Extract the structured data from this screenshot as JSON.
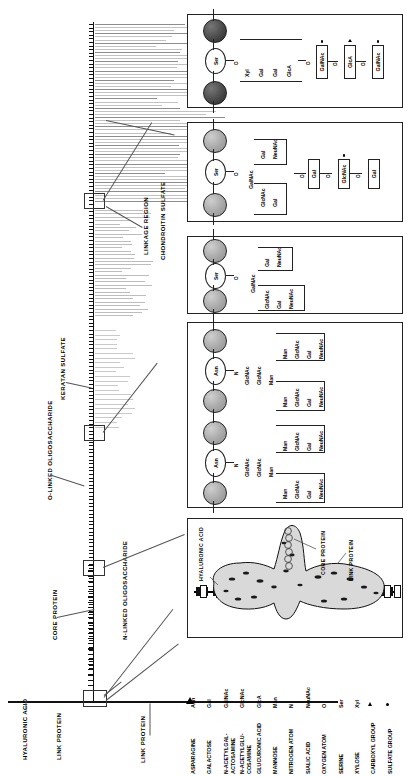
{
  "figure": {
    "orientation": "rotated-90"
  },
  "axis_labels": {
    "hyaluronic_acid": "HYALURONIC ACID",
    "link_protein_1": "LINK PROTEIN",
    "link_protein_2": "LINK PROTEIN",
    "core_protein": "CORE PROTEIN",
    "n_linked": "N-LINKED OLIGOSACCHARIDE",
    "o_linked": "O-LINKED OLIGOSACCHARIDE",
    "keratan_sulfate": "KERATAN SULFATE",
    "linkage_region": "LINKAGE REGION",
    "chondroitin_sulfate": "CHONDROITIN SULFATE"
  },
  "panels": {
    "chondroitin": {
      "name": "chondroitin-sulfate-panel",
      "residue": "Ser",
      "bond": "O",
      "linkage_chain": [
        "Xyl",
        "Gal",
        "Gal",
        "GlcA"
      ],
      "repeat": [
        {
          "label": "GalNAc",
          "modifier": "sulfate"
        },
        {
          "label": "GlcA",
          "modifier": "carboxyl"
        },
        {
          "label": "GalNAc",
          "modifier": "sulfate"
        }
      ],
      "bond_marks": [
        "O",
        "O",
        "O",
        "O"
      ]
    },
    "keratan": {
      "name": "keratan-sulfate-panel",
      "residue": "Ser",
      "bond": "O",
      "core": [
        "GalNAc"
      ],
      "branch_upper": [
        "Gal",
        "NeuNAc"
      ],
      "branch_lower": [
        "GlcNAc",
        "Gal"
      ],
      "repeat": [
        {
          "label": "Gal",
          "modifier": ""
        },
        {
          "label": "GlcNAc",
          "modifier": "sulfate"
        },
        {
          "label": "Gal",
          "modifier": ""
        }
      ]
    },
    "o_linked": {
      "name": "o-linked-oligosaccharide-panel",
      "residue": "Ser",
      "bond": "O",
      "core": [
        "GalNAc"
      ],
      "branch_upper": [
        "Gal",
        "NeuNAc"
      ],
      "branch_lower": [
        "GlcNAc",
        "Gal",
        "NeuNAc"
      ]
    },
    "n_linked": {
      "name": "n-linked-oligosaccharide-panel",
      "residue": "Asn",
      "bond": "N",
      "core": [
        "GlcNAc",
        "GlcNAc",
        "Man"
      ],
      "branch_upper": [
        "Man",
        "GlcNAc",
        "Gal",
        "NeuNAc"
      ],
      "branch_lower": [
        "Man",
        "GlcNAc",
        "Gal",
        "NeuNAc"
      ],
      "units": 2
    },
    "aggregate": {
      "name": "proteoglycan-aggregate-panel",
      "labels": {
        "hyaluronic_acid": "HYALURONIC ACID",
        "core_protein": "CORE PROTEIN",
        "link_protein": "LINK PROTEIN"
      }
    }
  },
  "legend": {
    "name": "abbreviation-legend",
    "entries": [
      {
        "abbr": "Asn",
        "name": "ASPARAGINE",
        "symbol": "text"
      },
      {
        "abbr": "Gal",
        "name": "GALACTOSE",
        "symbol": "text"
      },
      {
        "abbr": "GalNAc",
        "name": "N-ACETYLGAL-\nACTOSAMINE",
        "symbol": "text"
      },
      {
        "abbr": "GlcNAc",
        "name": "N-ACETYLGLU-\nCOSAMINE",
        "symbol": "text"
      },
      {
        "abbr": "GlcA",
        "name": "GLUCURONIC ACID",
        "symbol": "text"
      },
      {
        "abbr": "Man",
        "name": "MANNOSE",
        "symbol": "text"
      },
      {
        "abbr": "N",
        "name": "NITROGEN ATOM",
        "symbol": "text"
      },
      {
        "abbr": "NeuNAc",
        "name": "SIALIC ACID",
        "symbol": "text"
      },
      {
        "abbr": "O",
        "name": "OXYGEN ATOM",
        "symbol": "text"
      },
      {
        "abbr": "Ser",
        "name": "SERINE",
        "symbol": "text"
      },
      {
        "abbr": "Xyl",
        "name": "XYLOSE",
        "symbol": "text"
      },
      {
        "abbr": "",
        "name": "CARBOXYL GROUP",
        "symbol": "triangle"
      },
      {
        "abbr": "",
        "name": "SULFATE GROUP",
        "symbol": "dot"
      }
    ]
  },
  "colors": {
    "ink": "#111111",
    "gag_chain": "#b7b7b7",
    "panel_border": "#222222",
    "blob_fill": "#d9d9d9"
  }
}
